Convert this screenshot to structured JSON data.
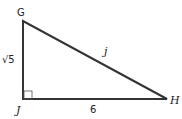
{
  "diagram": {
    "type": "right-triangle",
    "vertices": [
      {
        "name": "G",
        "label": "G",
        "x": 23,
        "y": 21
      },
      {
        "name": "J",
        "label": "J",
        "x": 23,
        "y": 99
      },
      {
        "name": "H",
        "label": "H",
        "x": 167,
        "y": 99
      }
    ],
    "right_angle_at": "J",
    "sides": {
      "GJ": {
        "label": "√5"
      },
      "JH": {
        "label": "6"
      },
      "GH": {
        "label": "j"
      }
    },
    "colors": {
      "stroke": "#333333",
      "background": "#ffffff"
    }
  }
}
